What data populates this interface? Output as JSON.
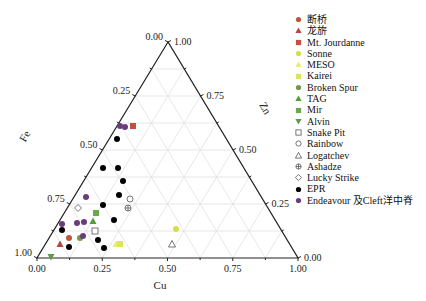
{
  "chart_data": {
    "type": "scatter",
    "subtype": "ternary",
    "axes": {
      "bottom": {
        "label": "Cu",
        "ticks": [
          "0.00",
          "0.25",
          "0.50",
          "0.75",
          "1.00"
        ]
      },
      "left": {
        "label": "Fe",
        "ticks": [
          "0.00",
          "0.25",
          "0.50",
          "0.75",
          "1.00"
        ]
      },
      "right": {
        "label": "Zn",
        "ticks": [
          "1.00",
          "0.75",
          "0.50",
          "0.25",
          "0.00"
        ]
      }
    },
    "grid": true,
    "legend_position": "right",
    "series": [
      {
        "name": "断桥",
        "marker": "circle",
        "color": "#c0573a",
        "points": [
          [
            69,
            238
          ]
        ]
      },
      {
        "name": "龙旂",
        "marker": "triangle",
        "color": "#b5483e",
        "points": [
          [
            60,
            244
          ]
        ]
      },
      {
        "name": "Mt. Jourdanne",
        "marker": "square",
        "color": "#c2503d",
        "points": [
          [
            133,
            126
          ]
        ]
      },
      {
        "name": "Sonne",
        "marker": "circle",
        "color": "#d4e04a",
        "points": [
          [
            176,
            229
          ]
        ]
      },
      {
        "name": "MESO",
        "marker": "triangle",
        "color": "#e6ef6a",
        "points": [
          [
            116,
            244
          ]
        ]
      },
      {
        "name": "Kairei",
        "marker": "square",
        "color": "#d9e55a",
        "points": [
          [
            120,
            244
          ]
        ]
      },
      {
        "name": "Broken Spur",
        "marker": "circle",
        "color": "#6e9a4a",
        "points": [
          [
            80,
            238
          ]
        ]
      },
      {
        "name": "TAG",
        "marker": "triangle",
        "color": "#4f9e3a",
        "points": [
          [
            93,
            221
          ]
        ]
      },
      {
        "name": "Mir",
        "marker": "square",
        "color": "#6aa84a",
        "points": [
          [
            96,
            213
          ]
        ]
      },
      {
        "name": "Alvin",
        "marker": "triangle-down",
        "color": "#5f9a46",
        "points": [
          [
            51,
            257
          ]
        ]
      },
      {
        "name": "Snake Pit",
        "marker": "open-square",
        "color": "#555555",
        "points": [
          [
            95,
            231
          ]
        ]
      },
      {
        "name": "Rainbow",
        "marker": "open-circle",
        "color": "#555555",
        "points": [
          [
            130,
            199
          ]
        ]
      },
      {
        "name": "Logatchev",
        "marker": "open-triangle",
        "color": "#555555",
        "points": [
          [
            172,
            244
          ]
        ]
      },
      {
        "name": "Ashadze",
        "marker": "crossed-circle",
        "color": "#555555",
        "points": [
          [
            128,
            208
          ]
        ]
      },
      {
        "name": "Lucky Strike",
        "marker": "open-diamond",
        "color": "#555555",
        "points": [
          [
            78,
            208
          ]
        ]
      },
      {
        "name": "EPR",
        "marker": "circle",
        "color": "#000000",
        "points": [
          [
            117,
            139
          ],
          [
            103,
            168
          ],
          [
            118,
            168
          ],
          [
            123,
            181
          ],
          [
            119,
            195
          ],
          [
            103,
            205
          ],
          [
            114,
            220
          ],
          [
            62,
            230
          ],
          [
            98,
            240
          ],
          [
            69,
            247
          ],
          [
            104,
            248
          ]
        ]
      },
      {
        "name": "Endeavour 及Cleft洋中脊",
        "marker": "circle",
        "color": "#6a3d7a",
        "points": [
          [
            120,
            126
          ],
          [
            125,
            127
          ],
          [
            86,
            197
          ],
          [
            77,
            223
          ],
          [
            84,
            222
          ],
          [
            62,
            224
          ],
          [
            83,
            236
          ]
        ]
      }
    ]
  },
  "legend": {
    "items": [
      {
        "label": "断桥",
        "marker": "circle",
        "color": "#c0573a"
      },
      {
        "label": "龙旂",
        "marker": "triangle",
        "color": "#b5483e"
      },
      {
        "label": "Mt. Jourdanne",
        "marker": "square",
        "color": "#c2503d"
      },
      {
        "label": "Sonne",
        "marker": "circle",
        "color": "#d4e04a"
      },
      {
        "label": "MESO",
        "marker": "triangle",
        "color": "#e6ef6a"
      },
      {
        "label": "Kairei",
        "marker": "square",
        "color": "#d9e55a"
      },
      {
        "label": "Broken Spur",
        "marker": "circle",
        "color": "#6e9a4a"
      },
      {
        "label": "TAG",
        "marker": "triangle",
        "color": "#4f9e3a"
      },
      {
        "label": "Mir",
        "marker": "square",
        "color": "#6aa84a"
      },
      {
        "label": "Alvin",
        "marker": "triangle-down",
        "color": "#5f9a46"
      },
      {
        "label": "Snake Pit",
        "marker": "open-square",
        "color": "#555555"
      },
      {
        "label": "Rainbow",
        "marker": "open-circle",
        "color": "#555555"
      },
      {
        "label": "Logatchev",
        "marker": "open-triangle",
        "color": "#555555"
      },
      {
        "label": "Ashadze",
        "marker": "crossed-circle",
        "color": "#555555"
      },
      {
        "label": "Lucky Strike",
        "marker": "open-diamond",
        "color": "#555555"
      },
      {
        "label": "EPR",
        "marker": "circle",
        "color": "#000000"
      },
      {
        "label": "Endeavour 及Cleft洋中脊",
        "marker": "circle",
        "color": "#6a3d7a"
      }
    ]
  }
}
